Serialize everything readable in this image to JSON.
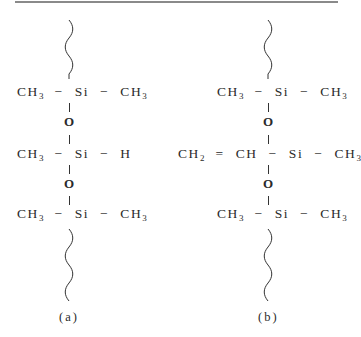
{
  "figure": {
    "structure_a": {
      "label": "(a)",
      "row1": {
        "left": "CH",
        "left_sub": "3",
        "bond_left": "−",
        "center": "Si",
        "bond_right": "−",
        "right": "CH",
        "right_sub": "3"
      },
      "link1": "O",
      "row2": {
        "left": "CH",
        "left_sub": "3",
        "bond_left": "−",
        "center": "Si",
        "bond_right": "−",
        "right": "H"
      },
      "link2": "O",
      "row3": {
        "left": "CH",
        "left_sub": "3",
        "bond_left": "−",
        "center": "Si",
        "bond_right": "−",
        "right": "CH",
        "right_sub": "3"
      }
    },
    "structure_b": {
      "label": "(b)",
      "row1": {
        "left": "CH",
        "left_sub": "3",
        "bond_left": "−",
        "center": "Si",
        "bond_right": "−",
        "right": "CH",
        "right_sub": "3"
      },
      "link1": "O",
      "row2": {
        "vinyl_a": "CH",
        "vinyl_a_sub": "2",
        "double_bond": "=",
        "vinyl_b": "CH",
        "bond_left": "−",
        "center": "Si",
        "bond_right": "−",
        "right": "CH",
        "right_sub": "3"
      },
      "link2": "O",
      "row3": {
        "left": "CH",
        "left_sub": "3",
        "bond_left": "−",
        "center": "Si",
        "bond_right": "−",
        "right": "CH",
        "right_sub": "3"
      }
    }
  }
}
